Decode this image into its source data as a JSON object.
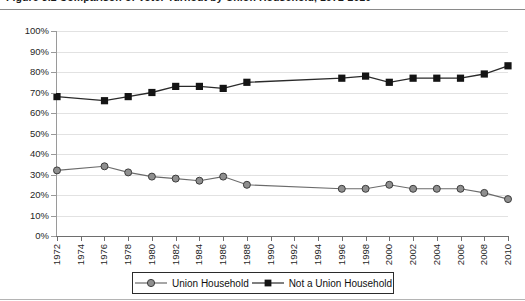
{
  "figure": {
    "title": "Figure 3.2  Comparison of Voter Turnout by Union Household, 1972-2010",
    "title_visible_fragment": ""
  },
  "legend": {
    "position": "bottom-center",
    "items": [
      {
        "label": "Union Household",
        "marker": "circle",
        "color": "#8f8f8f",
        "line_color": "#6b6b6b"
      },
      {
        "label": "Not a Union Household",
        "marker": "square",
        "color": "#141414",
        "line_color": "#2a2a2a"
      }
    ]
  },
  "axes": {
    "y_ticks": [
      "0%",
      "10%",
      "20%",
      "30%",
      "40%",
      "50%",
      "60%",
      "70%",
      "80%",
      "90%",
      "100%"
    ],
    "x_ticks": [
      "1972",
      "1974",
      "1976",
      "1978",
      "1980",
      "1982",
      "1984",
      "1986",
      "1988",
      "1990",
      "1992",
      "1994",
      "1996",
      "1998",
      "2000",
      "2002",
      "2004",
      "2006",
      "2008",
      "2010"
    ]
  },
  "chart_data": {
    "type": "line",
    "title": "Comparison of Voter Turnout by Union Household, 1972-2010",
    "xlabel": "",
    "ylabel": "",
    "ylim": [
      0,
      100
    ],
    "ytick_step": 10,
    "ytick_format": "percent",
    "xlim": [
      1972,
      2010
    ],
    "xtick_step": 2,
    "grid": "horizontal",
    "x": [
      1972,
      1974,
      1976,
      1978,
      1980,
      1982,
      1984,
      1986,
      1988,
      1990,
      1992,
      1994,
      1996,
      1998,
      2000,
      2002,
      2004,
      2006,
      2008,
      2010
    ],
    "series": [
      {
        "name": "Union Household",
        "marker": "circle",
        "color": "#8f8f8f",
        "values": [
          32,
          null,
          34,
          31,
          29,
          28,
          27,
          29,
          25,
          null,
          null,
          null,
          23,
          23,
          25,
          23,
          23,
          23,
          21,
          18
        ]
      },
      {
        "name": "Not a Union Household",
        "marker": "square",
        "color": "#141414",
        "values": [
          68,
          null,
          66,
          68,
          70,
          73,
          73,
          72,
          75,
          null,
          null,
          null,
          77,
          78,
          75,
          77,
          77,
          77,
          79,
          83
        ]
      }
    ]
  },
  "colors": {
    "gridline": "#e2e2e2",
    "axis": "#6e6e6e",
    "union": "#8f8f8f",
    "non_union": "#141414",
    "background": "#ffffff"
  }
}
